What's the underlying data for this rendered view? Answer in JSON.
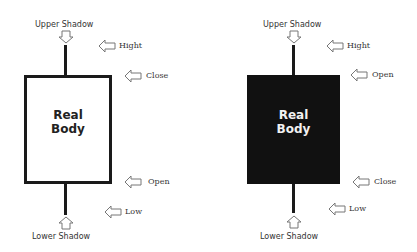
{
  "left_candle": {
    "type": "bullish",
    "body_color": "#ffffff",
    "border_color": "#1a1a1a",
    "body_label_line1": "Real",
    "body_label_line2": "Body",
    "upper_shadow_label": "Upper Shadow",
    "lower_shadow_label": "Lower Shadow",
    "markers": {
      "high": "Hight",
      "top": "Close",
      "bottom": "Open",
      "low": "Low"
    }
  },
  "right_candle": {
    "type": "bearish",
    "body_color": "#111111",
    "body_label_line1": "Real",
    "body_label_line2": "Body",
    "upper_shadow_label": "Upper Shadow",
    "lower_shadow_label": "Lower Shadow",
    "markers": {
      "high": "Hight",
      "top": "Open",
      "bottom": "Close",
      "low": "Low"
    }
  }
}
